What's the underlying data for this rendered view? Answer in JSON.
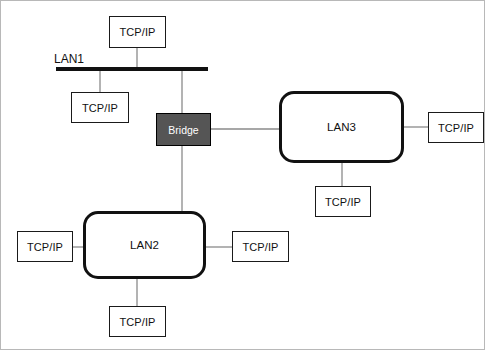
{
  "diagram": {
    "colors": {
      "line": "#8a8a8a",
      "bus": "#111111",
      "bridge_fill": "#555555",
      "bridge_text": "#ffffff",
      "node_border": "#1a1a1a",
      "lan_border": "#111111",
      "background": "#ffffff"
    },
    "bus_label": "LAN1",
    "bridge": {
      "label": "Bridge"
    },
    "lans": [
      {
        "id": "lan2",
        "label": "LAN2"
      },
      {
        "id": "lan3",
        "label": "LAN3"
      }
    ],
    "hosts": [
      {
        "id": "host-lan1-top",
        "label": "TCP/IP",
        "attached_to": "LAN1"
      },
      {
        "id": "host-lan1-left",
        "label": "TCP/IP",
        "attached_to": "LAN1"
      },
      {
        "id": "host-lan3-right",
        "label": "TCP/IP",
        "attached_to": "LAN3"
      },
      {
        "id": "host-lan3-bottom",
        "label": "TCP/IP",
        "attached_to": "LAN3"
      },
      {
        "id": "host-lan2-left",
        "label": "TCP/IP",
        "attached_to": "LAN2"
      },
      {
        "id": "host-lan2-right",
        "label": "TCP/IP",
        "attached_to": "LAN2"
      },
      {
        "id": "host-lan2-bottom",
        "label": "TCP/IP",
        "attached_to": "LAN2"
      }
    ]
  }
}
